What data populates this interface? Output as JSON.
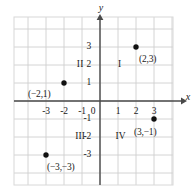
{
  "chart_data": {
    "type": "scatter",
    "title": "",
    "xlabel": "x",
    "ylabel": "y",
    "xlim": [
      -3.8,
      4.05
    ],
    "ylim": [
      -4.05,
      3.8
    ],
    "grid": true,
    "grid_step": 1,
    "legend": "none",
    "x_ticks": [
      "-3",
      "-2",
      "-1",
      "0",
      "1",
      "2",
      "3"
    ],
    "x_tick_values": [
      -3,
      -2,
      -1,
      0,
      1,
      2,
      3
    ],
    "y_ticks": [
      "3",
      "2",
      "1",
      "-1",
      "-2",
      "-3"
    ],
    "y_tick_values": [
      3,
      2,
      1,
      -1,
      -2,
      -3
    ],
    "origin_label": "0",
    "points": [
      {
        "name": "point-2-3",
        "label": "(2,3)",
        "x": 2,
        "y": 3,
        "label_dx": 3,
        "label_dy": 13
      },
      {
        "name": "point-neg2-1",
        "label": "(−2,1)",
        "x": -2,
        "y": 1,
        "label_dx": -36,
        "label_dy": 12
      },
      {
        "name": "point-3-neg1",
        "label": "(3,−1)",
        "x": 3,
        "y": -1,
        "label_dx": -20,
        "label_dy": 14
      },
      {
        "name": "point-neg3-neg3",
        "label": "(−3,−3)",
        "x": -3,
        "y": -3,
        "label_dx": 1,
        "label_dy": 13
      }
    ],
    "quadrants": [
      {
        "name": "quadrant-1",
        "label": "I",
        "x": 1.1,
        "y": 2
      },
      {
        "name": "quadrant-2",
        "label": "II",
        "x": -1.1,
        "y": 2
      },
      {
        "name": "quadrant-3",
        "label": "III",
        "x": -1.1,
        "y": -2
      },
      {
        "name": "quadrant-4",
        "label": "IV",
        "x": 1.15,
        "y": -2
      }
    ]
  },
  "colors": {
    "axis": "#4a4a4a",
    "grid": "#cfcfcf",
    "border": "#d8d8d8",
    "point": "#111111",
    "text": "#1a1a1a",
    "background": "#ffffff"
  }
}
